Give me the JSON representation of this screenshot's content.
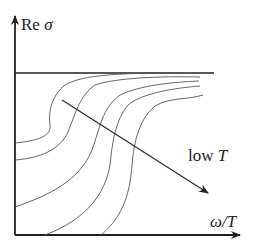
{
  "figure": {
    "y_axis_label_prefix": "Re",
    "y_axis_label_symbol": "σ",
    "x_axis_label": "ω/T",
    "arrow_label_prefix": "low",
    "arrow_label_symbol": "T",
    "colors": {
      "axis": "#222222",
      "curve": "#555555",
      "text": "#222222",
      "background": "#ffffff"
    }
  },
  "curves": [
    {
      "name": "curve-1",
      "d": "M15,143 C35,141 52,137 50,125 C48,112 52,95 65,85 C80,76 110,74 150,73"
    },
    {
      "name": "curve-2",
      "d": "M15,160 C40,158 60,150 68,132 C76,112 80,95 95,85 C115,78 160,76 200,77"
    },
    {
      "name": "curve-3",
      "d": "M15,207 C50,195 80,180 92,150 C100,128 102,108 120,95 C140,85 175,82 199,81"
    },
    {
      "name": "curve-4",
      "d": "M45,235 C85,220 105,195 110,165 C112,145 115,120 128,105 C142,93 175,88 200,86"
    },
    {
      "name": "curve-5",
      "d": "M101,235 C125,215 130,190 132,165 C134,140 140,118 155,106 C170,97 188,100 203,95"
    }
  ]
}
